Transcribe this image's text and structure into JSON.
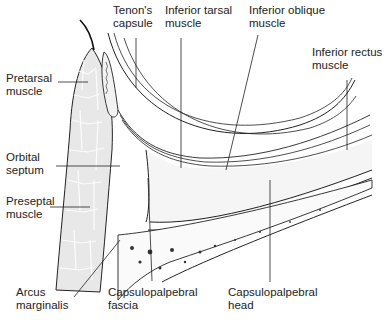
{
  "diagram": {
    "type": "anatomical cross-section",
    "labels": {
      "tenons_capsule": "Tenon's\ncapsule",
      "inferior_tarsal_muscle": "Inferior tarsal\nmuscle",
      "inferior_oblique_muscle": "Inferior oblique\nmuscle",
      "inferior_rectus_muscle": "Inferior rectus\nmuscle",
      "pretarsal_muscle": "Pretarsal\nmuscle",
      "orbital_septum": "Orbital\nseptum",
      "preseptal_muscle": "Preseptal\nmuscle",
      "arcus_marginalis": "Arcus\nmarginalis",
      "capsulopalpebral_fascia": "Capsulopalpebral\nfascia",
      "capsulopalpebral_head": "Capsulopalpebral\nhead"
    },
    "colors": {
      "line": "#222222",
      "muscle_light": "#e6e6e6",
      "muscle_dark": "#6f6f6f",
      "fat": "#f4f4f4",
      "bone": "#fafafa"
    }
  }
}
